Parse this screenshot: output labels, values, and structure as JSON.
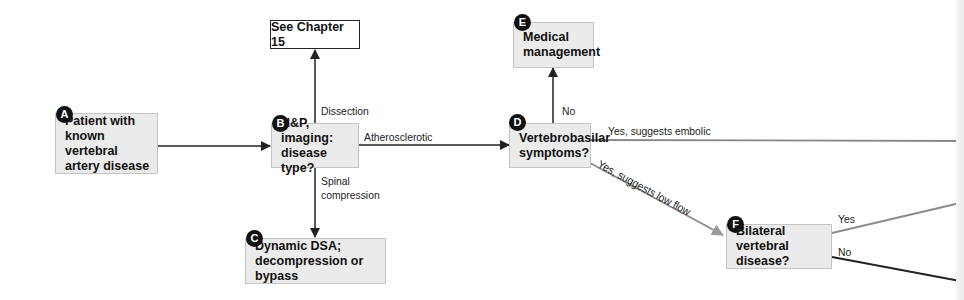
{
  "nodes": {
    "A": {
      "badge": "A",
      "lines": [
        "Patient with",
        "known vertebral",
        "artery disease"
      ]
    },
    "B": {
      "badge": "B",
      "lines": [
        "H&P, imaging:",
        "disease type?"
      ]
    },
    "C": {
      "badge": "C",
      "lines": [
        "Dynamic DSA;",
        "decompression or bypass"
      ]
    },
    "D": {
      "badge": "D",
      "lines": [
        "Vertebrobasilar",
        "symptoms?"
      ]
    },
    "E": {
      "badge": "E",
      "lines": [
        "Medical",
        "management"
      ]
    },
    "F": {
      "badge": "F",
      "lines": [
        "Bilateral vertebral",
        "disease?"
      ]
    },
    "ch15": {
      "text": "See Chapter 15"
    }
  },
  "edges": {
    "dissection": "Dissection",
    "atherosclerotic": "Atherosclerotic",
    "spinal": [
      "Spinal",
      "compression"
    ],
    "no_d": "No",
    "embolic": "Yes, suggests embolic",
    "low_flow": "Yes, suggests low flow",
    "f_yes": "Yes",
    "f_no": "No"
  },
  "colors": {
    "box_fill": "#ebebeb",
    "line_dark": "#222222",
    "line_gray": "#8a8a8a"
  }
}
